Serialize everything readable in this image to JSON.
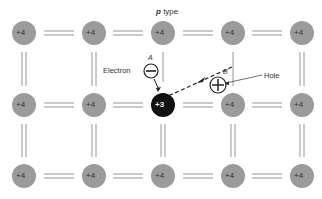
{
  "title": {
    "prefix": "p",
    "text": "type"
  },
  "labels": {
    "electron": "Electron",
    "hole": "Hole",
    "a": "A",
    "b": "B"
  },
  "atoms": {
    "normal_charge": "+4",
    "acceptor_charge": "+3"
  },
  "colors": {
    "atom": "#9b9b9b",
    "acceptor": "#111111",
    "bond": "#8a8a8a",
    "text": "#333333"
  }
}
